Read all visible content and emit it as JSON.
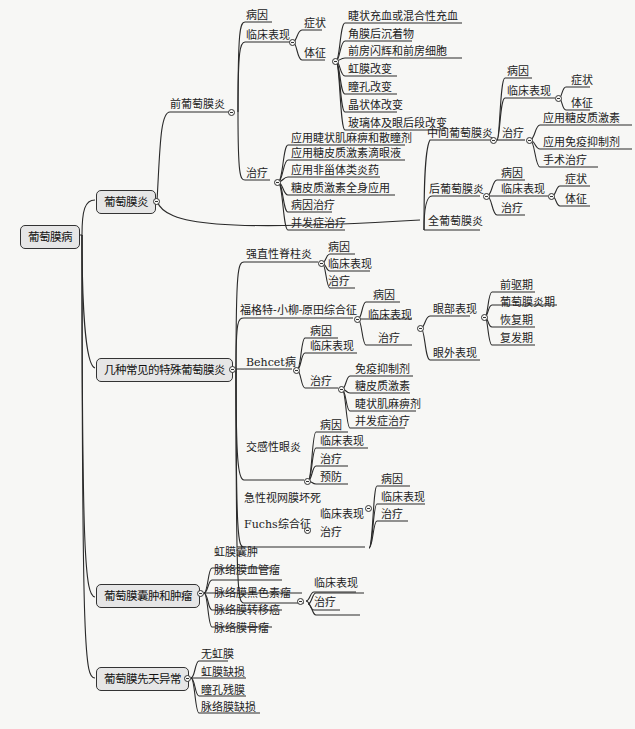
{
  "root": "葡萄膜病",
  "branches": {
    "uveitis": {
      "label": "葡萄膜炎",
      "anterior": {
        "label": "前葡萄膜炎",
        "cause": "病因",
        "clinical": "临床表现",
        "symptom": "症状",
        "sign": "体征",
        "signs": [
          "睫状充血或混合性充血",
          "角膜后沉着物",
          "前房闪辉和前房细胞",
          "虹膜改变",
          "瞳孔改变",
          "晶状体改变",
          "玻璃体及眼后段改变"
        ],
        "treatment": "治疗",
        "treatments": [
          "应用睫状肌麻痹和散瞳剂",
          "应用糖皮质激素滴眼液",
          "应用非甾体类炎药",
          "糖皮质激素全身应用",
          "病因治疗",
          "并发症治疗"
        ]
      },
      "intermediate": {
        "label": "中间葡萄膜炎",
        "cause": "病因",
        "clinical": "临床表现",
        "symptom": "症状",
        "sign": "体征",
        "treatment": "治疗",
        "treatments": [
          "应用糖皮质激素",
          "应用免疫抑制剂",
          "手术治疗"
        ]
      },
      "posterior": {
        "label": "后葡萄膜炎",
        "cause": "病因",
        "clinical": "临床表现",
        "symptom": "症状",
        "sign": "体征",
        "treatment": "治疗"
      },
      "pan": {
        "label": "全葡萄膜炎"
      }
    },
    "special": {
      "label": "几种常见的特殊葡萄膜炎",
      "as": {
        "label": "强直性脊柱炎",
        "items": [
          "病因",
          "临床表现",
          "治疗"
        ]
      },
      "vkh": {
        "label": "福格特-小柳-原田综合征",
        "items": [
          "病因",
          "临床表现",
          "治疗"
        ],
        "ocular": "眼部表现",
        "stages": [
          "前驱期",
          "葡萄膜炎期",
          "恢复期",
          "复发期"
        ],
        "extraocular": "眼外表现"
      },
      "behcet": {
        "label": "Behcet病",
        "items": [
          "病因",
          "临床表现",
          "治疗"
        ],
        "treatments": [
          "免疫抑制剂",
          "糖皮质激素",
          "睫状肌麻痹剂",
          "并发症治疗"
        ]
      },
      "sympathetic": {
        "label": "交感性眼炎",
        "items": [
          "病因",
          "临床表现",
          "治疗",
          "预防"
        ]
      },
      "arn": {
        "label": "急性视网膜坏死",
        "items": [
          "病因",
          "临床表现",
          "治疗"
        ]
      },
      "fuchs": {
        "label": "Fuchs综合征",
        "items": [
          "临床表现",
          "治疗"
        ]
      }
    },
    "tumor": {
      "label": "葡萄膜囊肿和肿瘤",
      "items": [
        "虹膜囊肿",
        "脉络膜血管瘤",
        "脉络膜黑色素瘤",
        "脉络膜转移癌",
        "脉络膜骨瘤"
      ],
      "melanoma_items": [
        "临床表现",
        "治疗"
      ]
    },
    "congenital": {
      "label": "葡萄膜先天异常",
      "items": [
        "无虹膜",
        "虹膜缺损",
        "瞳孔残膜",
        "脉络膜缺损"
      ]
    }
  }
}
